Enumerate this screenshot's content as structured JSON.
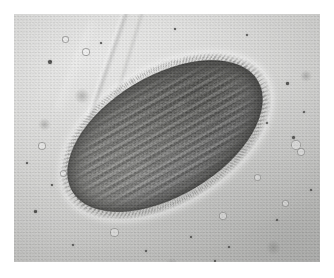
{
  "figure": {
    "kind": "light-micrograph",
    "subject_label": "ciliate-protozoan",
    "caption": "",
    "width_px": 334,
    "height_px": 278
  },
  "plate": {
    "label": "micrograph-plate",
    "left_px": 14,
    "top_px": 14,
    "width_px": 306,
    "height_px": 248,
    "border_color": "#ffffff",
    "background_color": "#c9c9c7"
  },
  "background": {
    "label": "microscope-field-of-view",
    "base_color": "#c9c9c7",
    "highlight_color": "#d8d8d6",
    "shadow_color": "#bdbdbb",
    "illumination": "brighter toward upper-left, dimmer toward lower-right"
  },
  "organism": {
    "label": "ciliate-cell",
    "shape": "elongated-ellipse",
    "rotation_deg": -31,
    "body_light_color": "#8b8b88",
    "body_mid_color": "#767673",
    "body_dark_color": "#6b6b69",
    "rim_color": "#454543",
    "halo_color": "#ffffff",
    "long_axis_px": 216,
    "short_axis_px": 120,
    "features": [
      "transverse ciliary-row striations",
      "radiating ciliary fringe",
      "bright diffraction halo",
      "mottled endoplasm"
    ]
  },
  "cilia": {
    "label": "ciliary-fringe",
    "color": "#464644",
    "visible_on": "entire margin, densest at upper-right pole"
  },
  "striations": {
    "label": "transverse-striations",
    "spacing_px": 7.5,
    "angle_deg": 3,
    "dark_color": "#1e1e1c",
    "light_color": "#bebebc"
  },
  "streaks": [
    {
      "name": "debris-streak-primary",
      "left": 92,
      "top": -22,
      "width": 7,
      "height": 132,
      "rotate": 19
    },
    {
      "name": "debris-streak-secondary",
      "left": 112,
      "top": -14,
      "width": 4,
      "height": 120,
      "rotate": 17
    },
    {
      "name": "debris-streak-tertiary",
      "left": 58,
      "top": 4,
      "width": 10,
      "height": 96,
      "rotate": 22
    }
  ],
  "particles": [
    {
      "type": "dot",
      "left": 34,
      "top": 46,
      "size": 4.0
    },
    {
      "type": "dot",
      "left": 86,
      "top": 28,
      "size": 2.2
    },
    {
      "type": "dot",
      "left": 160,
      "top": 14,
      "size": 2.4
    },
    {
      "type": "dot",
      "left": 232,
      "top": 20,
      "size": 2.0
    },
    {
      "type": "dot",
      "left": 272,
      "top": 68,
      "size": 2.6
    },
    {
      "type": "dot",
      "left": 289,
      "top": 97,
      "size": 2.0
    },
    {
      "type": "dot",
      "left": 278,
      "top": 122,
      "size": 3.0
    },
    {
      "type": "dot",
      "left": 252,
      "top": 108,
      "size": 1.8
    },
    {
      "type": "dot",
      "left": 296,
      "top": 175,
      "size": 2.2
    },
    {
      "type": "dot",
      "left": 262,
      "top": 205,
      "size": 2.4
    },
    {
      "type": "dot",
      "left": 214,
      "top": 232,
      "size": 2.2
    },
    {
      "type": "dot",
      "left": 176,
      "top": 222,
      "size": 1.8
    },
    {
      "type": "dot",
      "left": 131,
      "top": 236,
      "size": 2.0
    },
    {
      "type": "dot",
      "left": 58,
      "top": 230,
      "size": 2.4
    },
    {
      "type": "dot",
      "left": 20,
      "top": 196,
      "size": 2.6
    },
    {
      "type": "dot",
      "left": 12,
      "top": 148,
      "size": 2.0
    },
    {
      "type": "dot",
      "left": 37,
      "top": 170,
      "size": 1.8
    },
    {
      "type": "dot",
      "left": 200,
      "top": 246,
      "size": 1.8
    },
    {
      "type": "vesicle",
      "left": 277,
      "top": 126,
      "size": 7.5
    },
    {
      "type": "vesicle",
      "left": 283,
      "top": 134,
      "size": 6.0
    },
    {
      "type": "vesicle",
      "left": 240,
      "top": 160,
      "size": 5.0
    },
    {
      "type": "vesicle",
      "left": 205,
      "top": 198,
      "size": 5.5
    },
    {
      "type": "vesicle",
      "left": 96,
      "top": 214,
      "size": 6.5
    },
    {
      "type": "vesicle",
      "left": 46,
      "top": 156,
      "size": 5.0
    },
    {
      "type": "vesicle",
      "left": 24,
      "top": 128,
      "size": 6.0
    },
    {
      "type": "vesicle",
      "left": 68,
      "top": 34,
      "size": 5.5
    },
    {
      "type": "vesicle",
      "left": 48,
      "top": 22,
      "size": 4.5
    },
    {
      "type": "vesicle",
      "left": 268,
      "top": 186,
      "size": 4.5
    },
    {
      "type": "smudge",
      "left": 60,
      "top": 74,
      "size": 16
    },
    {
      "type": "smudge",
      "left": 24,
      "top": 104,
      "size": 13
    },
    {
      "type": "smudge",
      "left": 252,
      "top": 226,
      "size": 15
    },
    {
      "type": "smudge",
      "left": 152,
      "top": 244,
      "size": 12
    },
    {
      "type": "smudge",
      "left": 286,
      "top": 56,
      "size": 12
    }
  ]
}
